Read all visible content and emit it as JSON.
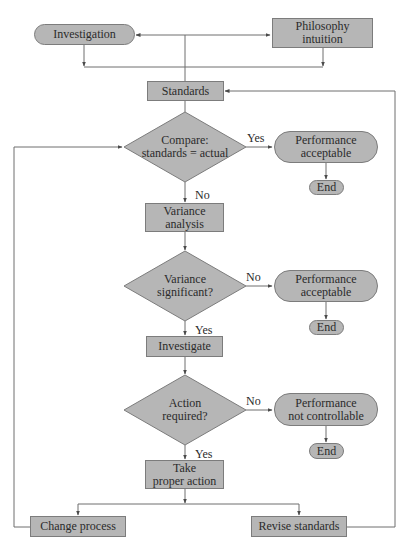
{
  "diagram": {
    "type": "flowchart",
    "style": {
      "node_fill": "#b6b6b6",
      "node_border": "#7c7c7c",
      "line_color": "#6e6e6e",
      "text_color": "#2b2b2b",
      "background": "#ffffff"
    },
    "nodes": {
      "investigation": {
        "label": "Investigation",
        "shape": "terminal"
      },
      "philosophy": {
        "label": "Philosophy\nintuition",
        "shape": "process"
      },
      "standards": {
        "label": "Standards",
        "shape": "process"
      },
      "compare": {
        "label": "Compare:\nstandards = actual",
        "shape": "decision"
      },
      "perf_acceptable_1": {
        "label": "Performance\nacceptable",
        "shape": "terminal"
      },
      "end_1": {
        "label": "End",
        "shape": "terminal"
      },
      "variance_analysis": {
        "label": "Variance\nanalysis",
        "shape": "process"
      },
      "variance_significant": {
        "label": "Variance\nsignificant?",
        "shape": "decision"
      },
      "perf_acceptable_2": {
        "label": "Performance\nacceptable",
        "shape": "terminal"
      },
      "end_2": {
        "label": "End",
        "shape": "terminal"
      },
      "investigate": {
        "label": "Investigate",
        "shape": "process"
      },
      "action_required": {
        "label": "Action\nrequired?",
        "shape": "decision"
      },
      "perf_not_controllable": {
        "label": "Performance\nnot controllable",
        "shape": "terminal"
      },
      "end_3": {
        "label": "End",
        "shape": "terminal"
      },
      "take_action": {
        "label": "Take\nproper action",
        "shape": "process"
      },
      "change_process": {
        "label": "Change process",
        "shape": "process"
      },
      "revise_standards": {
        "label": "Revise standards",
        "shape": "process"
      }
    },
    "edge_labels": {
      "compare_yes": "Yes",
      "compare_no": "No",
      "variance_no": "No",
      "variance_yes": "Yes",
      "action_no": "No",
      "action_yes": "Yes"
    },
    "edges": [
      {
        "from": "standards",
        "to": "investigation",
        "label": ""
      },
      {
        "from": "standards",
        "to": "philosophy",
        "label": ""
      },
      {
        "from": "investigation",
        "to": "standards",
        "label": ""
      },
      {
        "from": "philosophy",
        "to": "standards",
        "label": ""
      },
      {
        "from": "standards",
        "to": "compare",
        "label": ""
      },
      {
        "from": "compare",
        "to": "perf_acceptable_1",
        "label": "Yes"
      },
      {
        "from": "perf_acceptable_1",
        "to": "end_1",
        "label": ""
      },
      {
        "from": "compare",
        "to": "variance_analysis",
        "label": "No"
      },
      {
        "from": "variance_analysis",
        "to": "variance_significant",
        "label": ""
      },
      {
        "from": "variance_significant",
        "to": "perf_acceptable_2",
        "label": "No"
      },
      {
        "from": "perf_acceptable_2",
        "to": "end_2",
        "label": ""
      },
      {
        "from": "variance_significant",
        "to": "investigate",
        "label": "Yes"
      },
      {
        "from": "investigate",
        "to": "action_required",
        "label": ""
      },
      {
        "from": "action_required",
        "to": "perf_not_controllable",
        "label": "No"
      },
      {
        "from": "perf_not_controllable",
        "to": "end_3",
        "label": ""
      },
      {
        "from": "action_required",
        "to": "take_action",
        "label": "Yes"
      },
      {
        "from": "take_action",
        "to": "change_process",
        "label": ""
      },
      {
        "from": "take_action",
        "to": "revise_standards",
        "label": ""
      },
      {
        "from": "change_process",
        "to": "compare",
        "label": ""
      },
      {
        "from": "revise_standards",
        "to": "standards",
        "label": ""
      }
    ]
  }
}
